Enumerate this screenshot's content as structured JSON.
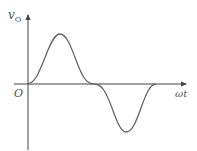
{
  "diagram": {
    "y_axis_label": "v",
    "y_axis_subscript": "O",
    "x_axis_label": "ωt",
    "origin_label": "O",
    "waveform": "one full sine-like cycle: positive half then negative half, smooth onset",
    "colors": {
      "axis": "#444444",
      "curve": "#666666",
      "text": "#555555"
    }
  }
}
